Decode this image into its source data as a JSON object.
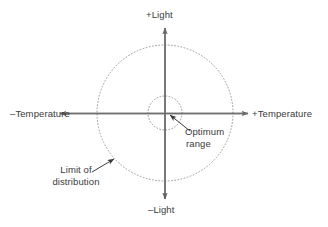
{
  "figure": {
    "kind": "two-axis-tolerance-diagram",
    "background_color": "#ffffff",
    "axis_color": "#6f6f6f",
    "circle_color": "#8a8a8a",
    "leader_color": "#3a3a3a",
    "text_color": "#3a3a3a"
  },
  "axes": {
    "vertical": {
      "positive_label": "+Light",
      "negative_label": "–Light"
    },
    "horizontal": {
      "negative_label": "–Temperature",
      "positive_label": "+Temperature"
    }
  },
  "annotations": {
    "optimum": {
      "line1": "Optimum",
      "line2": "range"
    },
    "limit": {
      "line1": "Limit of",
      "line2": "distribution"
    }
  },
  "geometry": {
    "center_x": 165,
    "center_y": 113,
    "inner_radius": 17,
    "outer_radius": 68,
    "axis_half_width": 105,
    "axis_half_height": 86
  }
}
